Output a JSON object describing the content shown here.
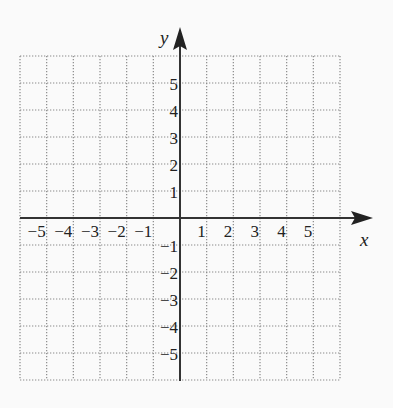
{
  "diagram": {
    "type": "coordinate-plane",
    "axes": {
      "x_label": "x",
      "y_label": "y",
      "x_range": [
        -6,
        6
      ],
      "y_range": [
        -6,
        6
      ],
      "x_ticks": [
        "-5",
        "-4",
        "-3",
        "-2",
        "-1",
        "1",
        "2",
        "3",
        "4",
        "5"
      ],
      "x_tick_values": [
        -5,
        -4,
        -3,
        -2,
        -1,
        1,
        2,
        3,
        4,
        5
      ],
      "y_ticks": [
        "5",
        "4",
        "3",
        "2",
        "1",
        "-1",
        "-2",
        "-3",
        "-4",
        "-5"
      ],
      "y_tick_values": [
        5,
        4,
        3,
        2,
        1,
        -1,
        -2,
        -3,
        -4,
        -5
      ]
    },
    "grid": {
      "style": "dotted",
      "cells_x": 12,
      "cells_y": 12
    },
    "colors": {
      "background": "#fafafa",
      "grid": "#8a8a8a",
      "axis": "#333333",
      "text": "#222222"
    }
  }
}
